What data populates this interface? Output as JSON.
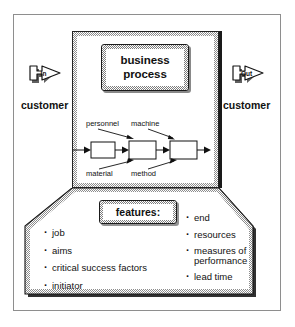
{
  "figure": {
    "outer_frame": "diagram-border"
  },
  "process": {
    "box_line1": "business",
    "box_line2": "process"
  },
  "io": {
    "in_label": "In",
    "out_label": "Out",
    "customer_left": "customer",
    "customer_right": "customer"
  },
  "flow": {
    "labels_top": [
      "personnel",
      "machine"
    ],
    "labels_bottom": [
      "material",
      "method"
    ],
    "step_count": 4
  },
  "features": {
    "title": "features:",
    "left_column": [
      "job",
      "aims",
      "critical success factors",
      "initiator"
    ],
    "right_column": [
      "end",
      "resources",
      "measures of\nperformance",
      "lead time"
    ]
  },
  "colors": {
    "ink": "#111111",
    "frame": "#8e8e8e",
    "hatch": "#8d8d8d",
    "shadow": "#1a1a1a",
    "paper": "#ffffff"
  }
}
